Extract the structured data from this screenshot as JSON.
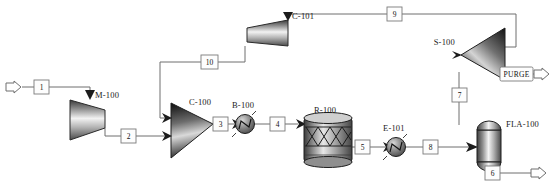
{
  "diagram": {
    "background_color": "#ffffff",
    "pipe_color": "#6f6f6f",
    "equipment_outline_color": "#2b2b2b",
    "label_color": "#1b1b1b"
  },
  "equipment": [
    {
      "tag": "M-100",
      "type": "compressor",
      "x": 112,
      "y": 95
    },
    {
      "tag": "C-100",
      "type": "mixer",
      "x": 187,
      "y": 100
    },
    {
      "tag": "B-100",
      "type": "heat-exchanger",
      "x": 245,
      "y": 104
    },
    {
      "tag": "R-100",
      "type": "packed-bed-reactor",
      "x": 327,
      "y": 108
    },
    {
      "tag": "E-101",
      "type": "heat-exchanger",
      "x": 396,
      "y": 127
    },
    {
      "tag": "FLA-100",
      "type": "flash-vessel",
      "x": 489,
      "y": 127
    },
    {
      "tag": "C-101",
      "type": "compressor",
      "x": 290,
      "y": 22
    },
    {
      "tag": "S-100",
      "type": "splitter",
      "x": 477,
      "y": 45
    }
  ],
  "streams": [
    {
      "id": "1",
      "label": "1",
      "x": 41,
      "y": 87,
      "kind": "feed"
    },
    {
      "id": "2",
      "label": "2",
      "x": 128,
      "y": 136,
      "kind": "process"
    },
    {
      "id": "3",
      "label": "3",
      "x": 220,
      "y": 124,
      "kind": "process"
    },
    {
      "id": "4",
      "label": "4",
      "x": 277,
      "y": 124,
      "kind": "process"
    },
    {
      "id": "5",
      "label": "5",
      "x": 362,
      "y": 147,
      "kind": "process"
    },
    {
      "id": "6",
      "label": "6",
      "x": 492,
      "y": 173,
      "kind": "product"
    },
    {
      "id": "7",
      "label": "7",
      "x": 459,
      "y": 95,
      "kind": "process"
    },
    {
      "id": "8",
      "label": "8",
      "x": 430,
      "y": 147,
      "kind": "process"
    },
    {
      "id": "9",
      "label": "9",
      "x": 394,
      "y": 14,
      "kind": "recycle"
    },
    {
      "id": "10",
      "label": "10",
      "x": 209,
      "y": 62,
      "kind": "recycle"
    }
  ],
  "named_streams": [
    {
      "id": "PURGE",
      "label": "PURGE",
      "x": 517,
      "y": 74,
      "kind": "product"
    }
  ],
  "feed_arrows": [
    {
      "name": "feed-inlet-arrow",
      "x": 12,
      "y": 87
    }
  ],
  "product_arrows": [
    {
      "name": "purge-outlet-arrow",
      "x": 540,
      "y": 74
    },
    {
      "name": "product-outlet-arrow",
      "x": 540,
      "y": 173
    }
  ]
}
